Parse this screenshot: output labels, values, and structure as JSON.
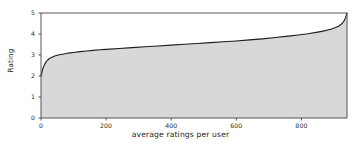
{
  "chart_data": {
    "type": "area",
    "title": "",
    "xlabel": "average ratings per user",
    "ylabel": "Rating",
    "xlim": [
      0,
      940
    ],
    "ylim": [
      0,
      5
    ],
    "grid": false,
    "legend": null,
    "xticks": [
      0,
      200,
      400,
      600,
      800
    ],
    "xtick_labels": [
      "0",
      "200",
      "400",
      "600",
      "800"
    ],
    "yticks": [
      0,
      1,
      2,
      3,
      4,
      5
    ],
    "ytick_labels": [
      "0",
      "1",
      "2",
      "3",
      "4",
      "5"
    ],
    "series": [
      {
        "name": "sorted average rating",
        "x": [
          0,
          5,
          10,
          15,
          20,
          25,
          30,
          40,
          50,
          60,
          70,
          80,
          90,
          100,
          120,
          140,
          160,
          180,
          200,
          240,
          280,
          320,
          360,
          400,
          440,
          480,
          520,
          560,
          600,
          640,
          680,
          720,
          760,
          790,
          820,
          850,
          870,
          890,
          905,
          915,
          925,
          932,
          937,
          940
        ],
        "y": [
          2.0,
          2.32,
          2.52,
          2.66,
          2.75,
          2.82,
          2.87,
          2.94,
          2.99,
          3.02,
          3.05,
          3.08,
          3.1,
          3.12,
          3.16,
          3.19,
          3.22,
          3.25,
          3.27,
          3.31,
          3.35,
          3.39,
          3.43,
          3.47,
          3.51,
          3.55,
          3.59,
          3.63,
          3.67,
          3.72,
          3.77,
          3.83,
          3.9,
          3.95,
          4.01,
          4.09,
          4.15,
          4.23,
          4.31,
          4.38,
          4.5,
          4.65,
          4.85,
          5.0
        ]
      }
    ],
    "colors": {
      "fill": "#d8d8d8",
      "line": "#1c1c1c",
      "frame": "#555555",
      "text": "#1d1d1d",
      "background": "#ffffff"
    }
  },
  "axes": {
    "ytick_positions_px": [
      118,
      97,
      76,
      55,
      34,
      13
    ],
    "xtick_positions_px": [
      41,
      106,
      172,
      237,
      302
    ],
    "plot_box_px": {
      "left": 41,
      "right": 347,
      "top": 13,
      "bottom": 118
    }
  }
}
